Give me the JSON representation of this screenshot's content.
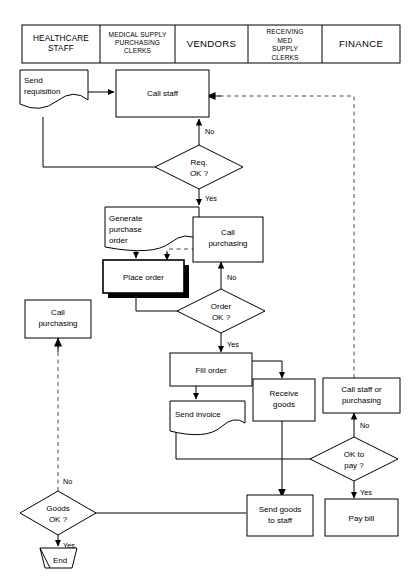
{
  "diagram": {
    "type": "swimlane-flowchart",
    "colors": {
      "line": "#000000",
      "dashed_line": "#4a4a4a",
      "shape_fill": "#ffffff",
      "shadow": "#000000",
      "background": "#ffffff"
    }
  },
  "header": {
    "columns": [
      {
        "id": "healthcare-staff",
        "lines": [
          "HEALTHCARE",
          "STAFF"
        ]
      },
      {
        "id": "medical-supply-purchasing-clerks",
        "lines": [
          "MEDICAL SUPPLY",
          "PURCHASING",
          "CLERKS"
        ]
      },
      {
        "id": "vendors",
        "lines": [
          "VENDORS"
        ]
      },
      {
        "id": "receiving-med-supply-clerks",
        "lines": [
          "RECEIVING",
          "MED",
          "SUPPLY",
          "CLERKS"
        ]
      },
      {
        "id": "finance",
        "lines": [
          "FINANCE"
        ]
      }
    ]
  },
  "nodes": {
    "send_requisition": {
      "id": "send-requisition",
      "shape": "document",
      "lines": [
        "Send",
        "requisition"
      ],
      "lane": "healthcare-staff"
    },
    "call_staff": {
      "id": "call-staff",
      "shape": "process",
      "lines": [
        "Call staff"
      ],
      "lane": "medical-supply-purchasing-clerks"
    },
    "req_ok": {
      "id": "req-ok-decision",
      "shape": "decision",
      "lines": [
        "Req.",
        "OK ?"
      ],
      "lane": "medical-supply-purchasing-clerks"
    },
    "generate_purchase_order": {
      "id": "generate-purchase-order",
      "shape": "document",
      "lines": [
        "Generate",
        "purchase",
        "order"
      ],
      "lane": "medical-supply-purchasing-clerks"
    },
    "place_order": {
      "id": "place-order",
      "shape": "process-shadow",
      "lines": [
        "Place order"
      ],
      "lane": "medical-supply-purchasing-clerks"
    },
    "call_purchasing_top": {
      "id": "call-purchasing-vendors",
      "shape": "process",
      "lines": [
        "Call",
        "purchasing"
      ],
      "lane": "vendors"
    },
    "order_ok": {
      "id": "order-ok-decision",
      "shape": "decision",
      "lines": [
        "Order",
        "OK ?"
      ],
      "lane": "vendors"
    },
    "fill_order": {
      "id": "fill-order",
      "shape": "process",
      "lines": [
        "Fill order"
      ],
      "lane": "vendors"
    },
    "send_invoice": {
      "id": "send-invoice",
      "shape": "document",
      "lines": [
        "Send invoice"
      ],
      "lane": "vendors"
    },
    "receive_goods": {
      "id": "receive-goods",
      "shape": "process",
      "lines": [
        "Receive",
        "goods"
      ],
      "lane": "receiving-med-supply-clerks"
    },
    "call_staff_or_purchasing": {
      "id": "call-staff-or-purchasing",
      "shape": "process",
      "lines": [
        "Call staff or",
        "purchasing"
      ],
      "lane": "finance"
    },
    "ok_to_pay": {
      "id": "ok-to-pay-decision",
      "shape": "decision",
      "lines": [
        "OK to",
        "pay ?"
      ],
      "lane": "finance"
    },
    "pay_bill": {
      "id": "pay-bill",
      "shape": "process",
      "lines": [
        "Pay bill"
      ],
      "lane": "finance"
    },
    "send_goods_to_staff": {
      "id": "send-goods-to-staff",
      "shape": "process",
      "lines": [
        "Send goods",
        "to staff"
      ],
      "lane": "receiving-med-supply-clerks"
    },
    "call_purchasing_left": {
      "id": "call-purchasing-healthcare",
      "shape": "process",
      "lines": [
        "Call",
        "purchasing"
      ],
      "lane": "healthcare-staff"
    },
    "goods_ok": {
      "id": "goods-ok-decision",
      "shape": "decision",
      "lines": [
        "Goods",
        "OK ?"
      ],
      "lane": "healthcare-staff"
    },
    "end": {
      "id": "end-terminator",
      "shape": "terminator",
      "lines": [
        "End"
      ],
      "lane": "healthcare-staff"
    }
  },
  "edge_labels": {
    "req_no": "No",
    "req_yes": "Yes",
    "order_no": "No",
    "order_yes": "Yes",
    "pay_no": "No",
    "pay_yes": "Yes",
    "goods_no": "No",
    "goods_yes": "Yes"
  }
}
